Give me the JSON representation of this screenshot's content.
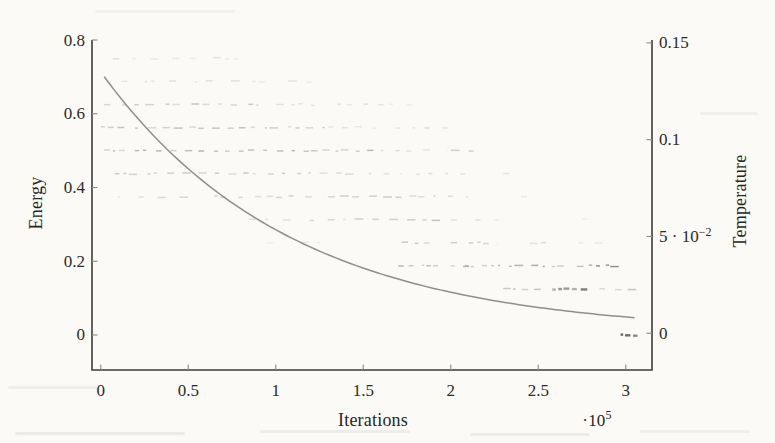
{
  "figure": {
    "energy_axis_label": "Energy",
    "temperature_axis_label": "Temperature",
    "iterations_axis_label": "Iterations",
    "x_multiplier_base": "·10",
    "x_multiplier_exp": "5"
  },
  "colors": {
    "background": "#fbfaf7",
    "axis_line": "#3c3c38",
    "tick_mark": "#8a8a84",
    "tick_text": "#2b2b27",
    "curve": "#8f8f8b",
    "scatter": "#55554f"
  },
  "chart_data": {
    "type": "scatter",
    "title": "",
    "xlabel": "Iterations",
    "x_unit_multiplier": "10^5",
    "x_range": [
      -0.05,
      3.15
    ],
    "x_ticks": [
      {
        "v": 0,
        "label": "0"
      },
      {
        "v": 0.5,
        "label": "0.5"
      },
      {
        "v": 1,
        "label": "1"
      },
      {
        "v": 1.5,
        "label": "1.5"
      },
      {
        "v": 2,
        "label": "2"
      },
      {
        "v": 2.5,
        "label": "2.5"
      },
      {
        "v": 3,
        "label": "3"
      }
    ],
    "y_left": {
      "label": "Energy",
      "range": [
        -0.095,
        0.8
      ],
      "ticks": [
        {
          "v": 0,
          "label": "0"
        },
        {
          "v": 0.2,
          "label": "0.2"
        },
        {
          "v": 0.4,
          "label": "0.4"
        },
        {
          "v": 0.6,
          "label": "0.6"
        },
        {
          "v": 0.8,
          "label": "0.8"
        }
      ]
    },
    "y_right": {
      "label": "Temperature",
      "range": [
        -0.019,
        0.1515
      ],
      "ticks": [
        {
          "v": 0,
          "label": "0"
        },
        {
          "v": 0.05,
          "label": "5 · 10",
          "sup": "−2"
        },
        {
          "v": 0.1,
          "label": "0.1"
        },
        {
          "v": 0.15,
          "label": "0.15"
        }
      ]
    },
    "series": [
      {
        "name": "temperature-schedule",
        "type": "line",
        "axis": "right",
        "model": "exponential_decay",
        "T0": 0.135,
        "tau_1e5": 1.08,
        "t_start": 0.02,
        "t_end": 3.05
      },
      {
        "name": "energy-samples",
        "type": "scatter-bands",
        "axis": "left",
        "note": "segments are [iter_start_1e5, iter_end_1e5, intensity]",
        "bands": [
          {
            "energy": 0.75,
            "segments": [
              [
                0.07,
                0.78,
                0.1
              ]
            ]
          },
          {
            "energy": 0.6875,
            "segments": [
              [
                0.12,
                0.55,
                0.12
              ],
              [
                0.6,
                1.25,
                0.1
              ]
            ]
          },
          {
            "energy": 0.625,
            "segments": [
              [
                0.02,
                0.95,
                0.2
              ],
              [
                1.0,
                1.63,
                0.11
              ],
              [
                1.65,
                1.78,
                0.08
              ]
            ]
          },
          {
            "energy": 0.5625,
            "segments": [
              [
                0.0,
                1.28,
                0.22
              ],
              [
                1.3,
                1.88,
                0.12
              ],
              [
                1.95,
                2.07,
                0.09
              ]
            ]
          },
          {
            "energy": 0.5,
            "segments": [
              [
                0.02,
                1.58,
                0.25
              ],
              [
                1.6,
                1.98,
                0.14
              ],
              [
                2.0,
                2.13,
                0.18
              ]
            ]
          },
          {
            "energy": 0.4375,
            "segments": [
              [
                0.08,
                1.2,
                0.2
              ],
              [
                1.25,
                2.12,
                0.13
              ],
              [
                2.3,
                2.45,
                0.09
              ]
            ]
          },
          {
            "energy": 0.375,
            "segments": [
              [
                0.1,
                0.55,
                0.13
              ],
              [
                0.65,
                1.28,
                0.18
              ],
              [
                1.3,
                1.85,
                0.2
              ],
              [
                1.9,
                2.1,
                0.16
              ],
              [
                2.4,
                2.5,
                0.08
              ]
            ]
          },
          {
            "energy": 0.3125,
            "segments": [
              [
                0.85,
                1.4,
                0.13
              ],
              [
                1.45,
                1.73,
                0.16
              ],
              [
                1.75,
                1.95,
                0.26
              ],
              [
                2.0,
                2.3,
                0.12
              ],
              [
                2.75,
                2.82,
                0.1
              ]
            ]
          },
          {
            "energy": 0.25,
            "segments": [
              [
                0.95,
                1.05,
                0.08
              ],
              [
                1.15,
                1.25,
                0.08
              ],
              [
                1.72,
                1.88,
                0.2
              ],
              [
                2.0,
                2.27,
                0.17
              ],
              [
                2.45,
                2.6,
                0.15
              ],
              [
                2.73,
                2.95,
                0.1
              ]
            ]
          },
          {
            "energy": 0.1875,
            "segments": [
              [
                1.7,
                1.92,
                0.3
              ],
              [
                1.9,
                2.12,
                0.2
              ],
              [
                2.07,
                2.42,
                0.28
              ],
              [
                2.46,
                2.67,
                0.32
              ],
              [
                2.72,
                2.97,
                0.4
              ]
            ]
          },
          {
            "energy": 0.125,
            "segments": [
              [
                2.3,
                2.52,
                0.28
              ],
              [
                2.58,
                2.8,
                0.5
              ],
              [
                2.85,
                3.08,
                0.2
              ]
            ]
          },
          {
            "energy": 0.0,
            "segments": [
              [
                2.97,
                3.08,
                0.8
              ]
            ]
          }
        ]
      }
    ]
  }
}
